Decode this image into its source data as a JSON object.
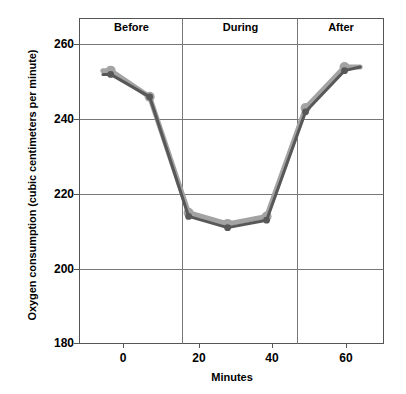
{
  "chart_data": {
    "type": "line",
    "title": "",
    "xlabel": "Minutes",
    "ylabel": "Oxygen consumption (cubic centimeters per minute)",
    "xlim": [
      -8,
      70
    ],
    "ylim": [
      180,
      263
    ],
    "yticks": [
      180,
      200,
      220,
      240,
      260
    ],
    "xticks": [
      0,
      20,
      40,
      60
    ],
    "grid": true,
    "legend": "none",
    "panels": [
      {
        "label": "Before",
        "x_start": -8,
        "x_end": 16
      },
      {
        "label": "During",
        "x_start": 16,
        "x_end": 47
      },
      {
        "label": "After",
        "x_start": 47,
        "x_end": 70
      }
    ],
    "series": [
      {
        "name": "series-light",
        "color": "#a3a3a3",
        "x": [
          -2,
          0,
          10,
          20,
          30,
          40,
          50,
          60,
          64
        ],
        "values": [
          253,
          253,
          246,
          215,
          212,
          214,
          243,
          254,
          254
        ]
      },
      {
        "name": "series-dark",
        "color": "#585858",
        "x": [
          -2,
          0,
          10,
          20,
          30,
          40,
          50,
          60,
          64
        ],
        "values": [
          252,
          252,
          246,
          214,
          211,
          213,
          242,
          253,
          254
        ]
      }
    ]
  },
  "axes": {
    "y_tick_labels": [
      "260",
      "240",
      "220",
      "200",
      "180"
    ],
    "x_tick_labels": [
      "0",
      "20",
      "40",
      "60"
    ],
    "x_title": "Minutes",
    "y_title": "Oxygen consumption (cubic centimeters per minute)"
  },
  "panel_labels": {
    "before": "Before",
    "during": "During",
    "after": "After"
  },
  "colors": {
    "series_light": "#a3a3a3",
    "series_dark": "#585858",
    "axis": "#4d4d4d",
    "grid": "#808080",
    "background": "#ffffff",
    "text": "#000000"
  }
}
